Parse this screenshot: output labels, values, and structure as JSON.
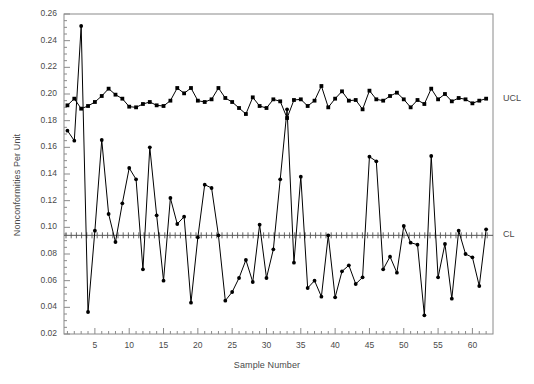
{
  "chart_data": {
    "type": "line",
    "title": "",
    "xlabel": "Sample Number",
    "ylabel": "Nonconformities Per Unit",
    "xlim": [
      0.5,
      63
    ],
    "ylim": [
      0.02,
      0.26
    ],
    "grid": false,
    "legend_position": "right-outside",
    "y_ticks": [
      "0.02",
      "0.04",
      "0.06",
      "0.08",
      "0.10",
      "0.12",
      "0.14",
      "0.16",
      "0.18",
      "0.20",
      "0.22",
      "0.24",
      "0.26"
    ],
    "y_tick_values": [
      0.02,
      0.04,
      0.06,
      0.08,
      0.1,
      0.12,
      0.14,
      0.16,
      0.18,
      0.2,
      0.22,
      0.24,
      0.26
    ],
    "y_minor_step": 0.005,
    "x_ticks": [
      "5",
      "10",
      "15",
      "20",
      "25",
      "30",
      "35",
      "40",
      "45",
      "50",
      "55",
      "60"
    ],
    "x_tick_values": [
      5,
      10,
      15,
      20,
      25,
      30,
      35,
      40,
      45,
      50,
      55,
      60
    ],
    "x_minor_step": 1,
    "center_line": {
      "label": "CL",
      "value": 0.094,
      "style": "solid-with-ticks"
    },
    "annotations": [
      {
        "name": "ucl-label",
        "text": "UCL",
        "y": 0.196
      },
      {
        "name": "cl-label",
        "text": "CL",
        "y": 0.094
      }
    ],
    "x": [
      1,
      2,
      3,
      4,
      5,
      6,
      7,
      8,
      9,
      10,
      11,
      12,
      13,
      14,
      15,
      16,
      17,
      18,
      19,
      20,
      21,
      22,
      23,
      24,
      25,
      26,
      27,
      28,
      29,
      30,
      31,
      32,
      33,
      34,
      35,
      36,
      37,
      38,
      39,
      40,
      41,
      42,
      43,
      44,
      45,
      46,
      47,
      48,
      49,
      50,
      51,
      52,
      53,
      54,
      55,
      56,
      57,
      58,
      59,
      60,
      61,
      62
    ],
    "series": [
      {
        "name": "UCL",
        "marker": "square",
        "color": "#000000",
        "values": [
          0.1915,
          0.1965,
          0.189,
          0.191,
          0.194,
          0.1985,
          0.204,
          0.1995,
          0.1965,
          0.1905,
          0.19,
          0.1925,
          0.194,
          0.1915,
          0.191,
          0.195,
          0.2045,
          0.2005,
          0.2045,
          0.195,
          0.194,
          0.196,
          0.2045,
          0.197,
          0.194,
          0.1895,
          0.185,
          0.1975,
          0.191,
          0.1895,
          0.196,
          0.1945,
          0.182,
          0.1955,
          0.196,
          0.191,
          0.195,
          0.206,
          0.19,
          0.1965,
          0.202,
          0.195,
          0.1955,
          0.1885,
          0.2025,
          0.196,
          0.195,
          0.1985,
          0.201,
          0.196,
          0.19,
          0.1955,
          0.1925,
          0.204,
          0.196,
          0.2,
          0.1945,
          0.197,
          0.196,
          0.193,
          0.195,
          0.1965
        ]
      },
      {
        "name": "Nonconformities Per Unit",
        "marker": "circle",
        "color": "#000000",
        "values": [
          0.1725,
          0.165,
          0.251,
          0.0365,
          0.0975,
          0.1655,
          0.11,
          0.089,
          0.118,
          0.1445,
          0.136,
          0.0685,
          0.16,
          0.109,
          0.06,
          0.122,
          0.1025,
          0.108,
          0.0435,
          0.0925,
          0.132,
          0.1295,
          0.094,
          0.045,
          0.0515,
          0.062,
          0.0755,
          0.059,
          0.102,
          0.062,
          0.0835,
          0.136,
          0.1885,
          0.0735,
          0.138,
          0.0545,
          0.06,
          0.048,
          0.094,
          0.0475,
          0.067,
          0.0715,
          0.0575,
          0.0625,
          0.153,
          0.1495,
          0.0685,
          0.078,
          0.066,
          0.101,
          0.0885,
          0.087,
          0.034,
          0.1535,
          0.0625,
          0.0875,
          0.0465,
          0.0975,
          0.08,
          0.0775,
          0.056,
          0.0985
        ]
      }
    ]
  }
}
